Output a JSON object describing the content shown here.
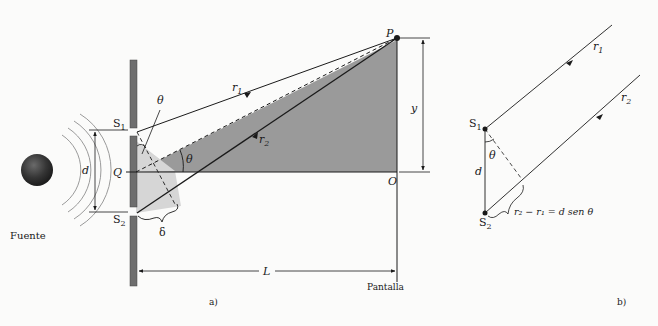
{
  "figure": {
    "panel_a": {
      "caption": "a)",
      "source_label": "Fuente",
      "slit_top_label": "S",
      "slit_top_sub": "1",
      "slit_bottom_label": "S",
      "slit_bottom_sub": "2",
      "center_label": "Q",
      "separation_label": "d",
      "angle_label_top": "θ",
      "angle_label_center": "θ",
      "path_diff_label": "δ",
      "ray1_label": "r",
      "ray1_sub": "1",
      "ray2_label": "r",
      "ray2_sub": "2",
      "point_label": "P",
      "origin_label": "O",
      "height_label": "y",
      "distance_label": "L",
      "screen_label": "Pantalla"
    },
    "panel_b": {
      "caption": "b)",
      "slit_top_label": "S",
      "slit_top_sub": "1",
      "slit_bottom_label": "S",
      "slit_bottom_sub": "2",
      "separation_label": "d",
      "angle_label": "θ",
      "ray1_label": "r",
      "ray1_sub": "1",
      "ray2_label": "r",
      "ray2_sub": "2",
      "equation": "r₂ − r₁ = d sen θ"
    },
    "colors": {
      "barrier": "#6e6e6e",
      "dark_shade": "#9a9a9a",
      "light_shade": "#d6d6d6",
      "line": "#1a1a1a",
      "source_sphere": "#3a3a3a"
    }
  }
}
